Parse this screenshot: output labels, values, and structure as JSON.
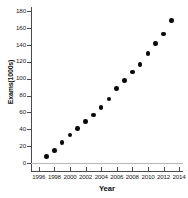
{
  "chart_data": {
    "type": "scatter",
    "title": "",
    "xlabel": "Year",
    "ylabel": "Exams(1000s)",
    "xlim": [
      1995,
      2014.5
    ],
    "ylim": [
      0,
      185
    ],
    "grid": false,
    "legend": null,
    "x_ticks": [
      1996,
      1998,
      2000,
      2002,
      2004,
      2006,
      2008,
      2010,
      2012,
      2014
    ],
    "y_ticks": [
      0,
      20,
      40,
      60,
      80,
      100,
      120,
      140,
      160,
      180
    ],
    "marker": "filled-circle",
    "marker_color": "#0a0a0a",
    "x": [
      1997,
      1998,
      1999,
      2000,
      2001,
      2002,
      2003,
      2004,
      2005,
      2006,
      2007,
      2008,
      2009,
      2010,
      2011,
      2012,
      2013
    ],
    "values": [
      8,
      15,
      24,
      33,
      41,
      49,
      57,
      66,
      76,
      88,
      98,
      108,
      117,
      130,
      142,
      153,
      169
    ],
    "series": [
      {
        "name": "Exams",
        "values": [
          8,
          15,
          24,
          33,
          41,
          49,
          57,
          66,
          76,
          88,
          98,
          108,
          117,
          130,
          142,
          153,
          169
        ]
      }
    ]
  }
}
